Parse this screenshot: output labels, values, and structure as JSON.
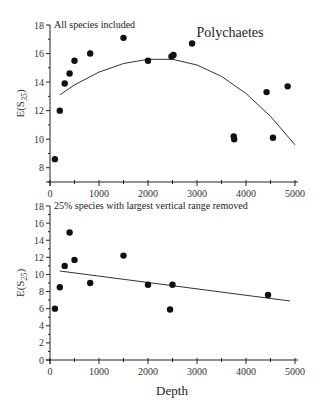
{
  "figure": {
    "title": "Polychaetes",
    "x_axis_title": "Depth"
  },
  "chart_data": [
    {
      "type": "scatter",
      "panel": "top",
      "title": "Polychaetes",
      "subtitle": "All species included",
      "xlabel": "Depth",
      "ylabel": "E(S35)",
      "ylabel_main": "E(S",
      "ylabel_sub": "35",
      "ylabel_close": ")",
      "xlim": [
        0,
        5000
      ],
      "ylim": [
        7,
        18
      ],
      "xticks": [
        0,
        1000,
        2000,
        3000,
        4000,
        5000
      ],
      "xtick_labels": [
        "0",
        "1000",
        "2000",
        "3000",
        "4000",
        "5000"
      ],
      "yticks": [
        8,
        10,
        12,
        14,
        16,
        18
      ],
      "ytick_labels": [
        "8",
        "10",
        "12",
        "14",
        "16",
        "18"
      ],
      "grid": false,
      "points": [
        {
          "x": 100,
          "y": 8.6
        },
        {
          "x": 200,
          "y": 12.0
        },
        {
          "x": 300,
          "y": 13.9
        },
        {
          "x": 400,
          "y": 14.6
        },
        {
          "x": 500,
          "y": 15.5
        },
        {
          "x": 820,
          "y": 16.0
        },
        {
          "x": 1500,
          "y": 17.1
        },
        {
          "x": 2000,
          "y": 15.5
        },
        {
          "x": 2480,
          "y": 15.8
        },
        {
          "x": 2520,
          "y": 15.9
        },
        {
          "x": 2900,
          "y": 16.7
        },
        {
          "x": 3750,
          "y": 10.2
        },
        {
          "x": 3760,
          "y": 10.0
        },
        {
          "x": 4420,
          "y": 13.3
        },
        {
          "x": 4550,
          "y": 10.1
        },
        {
          "x": 4850,
          "y": 13.7
        }
      ],
      "fit": {
        "type": "quadratic",
        "points": [
          {
            "x": 200,
            "y": 13.1
          },
          {
            "x": 500,
            "y": 13.8
          },
          {
            "x": 1000,
            "y": 14.7
          },
          {
            "x": 1500,
            "y": 15.3
          },
          {
            "x": 2000,
            "y": 15.6
          },
          {
            "x": 2500,
            "y": 15.6
          },
          {
            "x": 3000,
            "y": 15.2
          },
          {
            "x": 3500,
            "y": 14.4
          },
          {
            "x": 4000,
            "y": 13.2
          },
          {
            "x": 4500,
            "y": 11.6
          },
          {
            "x": 5000,
            "y": 9.6
          }
        ]
      }
    },
    {
      "type": "scatter",
      "panel": "bottom",
      "subtitle": "25% species with largest vertical range removed",
      "xlabel": "Depth",
      "ylabel": "E(S25)",
      "ylabel_main": "E(S",
      "ylabel_sub": "25",
      "ylabel_close": ")",
      "xlim": [
        0,
        5000
      ],
      "ylim": [
        0,
        18
      ],
      "xticks": [
        0,
        1000,
        2000,
        3000,
        4000,
        5000
      ],
      "xtick_labels": [
        "0",
        "1000",
        "2000",
        "3000",
        "4000",
        "5000"
      ],
      "yticks": [
        0,
        2,
        4,
        6,
        8,
        10,
        12,
        14,
        16,
        18
      ],
      "ytick_labels": [
        "0",
        "2",
        "4",
        "6",
        "8",
        "10",
        "12",
        "14",
        "16",
        "18"
      ],
      "grid": false,
      "points": [
        {
          "x": 100,
          "y": 6.0
        },
        {
          "x": 200,
          "y": 8.5
        },
        {
          "x": 300,
          "y": 11.0
        },
        {
          "x": 400,
          "y": 14.9
        },
        {
          "x": 500,
          "y": 11.7
        },
        {
          "x": 820,
          "y": 9.0
        },
        {
          "x": 1500,
          "y": 12.2
        },
        {
          "x": 2000,
          "y": 8.8
        },
        {
          "x": 2450,
          "y": 5.9
        },
        {
          "x": 2500,
          "y": 8.8
        },
        {
          "x": 4450,
          "y": 7.6
        }
      ],
      "fit": {
        "type": "linear",
        "points": [
          {
            "x": 200,
            "y": 10.4
          },
          {
            "x": 4900,
            "y": 6.9
          }
        ]
      }
    }
  ]
}
